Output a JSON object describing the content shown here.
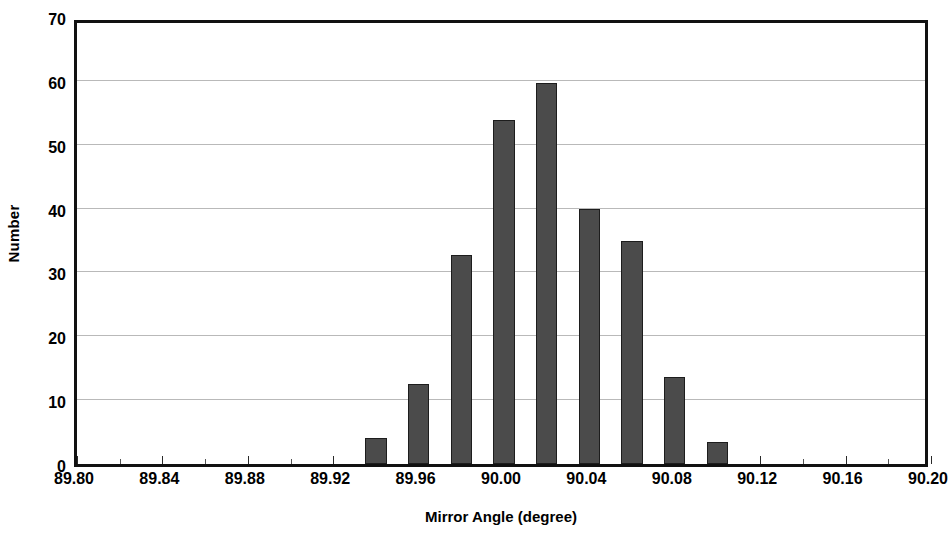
{
  "chart_data": {
    "type": "bar",
    "title": "",
    "subtitle": "",
    "xlabel": "Mirror Angle (degree)",
    "ylabel": "Number",
    "xlim": [
      89.8,
      90.2
    ],
    "ylim": [
      0,
      70
    ],
    "grid": true,
    "legend": false,
    "legend_position": "none",
    "bar_color": "#4b4b4b",
    "bar_edge_color": "#1d1d1d",
    "grid_color": "#b9b9b9",
    "axis_color": "#111111",
    "bin_width": 0.02,
    "x_tick_step": 0.04,
    "y_tick_step": 10,
    "x_ticks": [
      89.8,
      89.84,
      89.88,
      89.92,
      89.96,
      90.0,
      90.04,
      90.08,
      90.12,
      90.16,
      90.2
    ],
    "x_tick_labels": [
      "89.80",
      "89.84",
      "89.88",
      "89.92",
      "89.96",
      "90.00",
      "90.04",
      "90.08",
      "90.12",
      "90.16",
      "90.20"
    ],
    "y_ticks": [
      0,
      10,
      20,
      30,
      40,
      50,
      60,
      70
    ],
    "y_tick_labels": [
      "0",
      "10",
      "20",
      "30",
      "40",
      "50",
      "60",
      "70"
    ],
    "x": [
      89.94,
      89.96,
      89.98,
      90.0,
      90.02,
      90.04,
      90.06,
      90.08,
      90.1
    ],
    "categories": [
      "89.94",
      "89.96",
      "89.98",
      "90.00",
      "90.02",
      "90.04",
      "90.06",
      "90.08",
      "90.10"
    ],
    "values": [
      4.0,
      12.5,
      32.7,
      53.8,
      59.7,
      40.0,
      35.0,
      13.7,
      3.5
    ],
    "bars": [
      {
        "x": 89.94,
        "value": 4.0
      },
      {
        "x": 89.96,
        "value": 12.5
      },
      {
        "x": 89.98,
        "value": 32.7
      },
      {
        "x": 90.0,
        "value": 53.8
      },
      {
        "x": 90.02,
        "value": 59.7
      },
      {
        "x": 90.04,
        "value": 40.0
      },
      {
        "x": 90.06,
        "value": 35.0
      },
      {
        "x": 90.08,
        "value": 13.7
      },
      {
        "x": 90.1,
        "value": 3.5
      }
    ]
  }
}
